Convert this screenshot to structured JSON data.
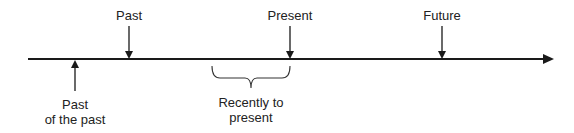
{
  "diagram": {
    "title": "",
    "axis": {
      "x_start": 28,
      "x_end": 553,
      "y": 59,
      "color": "#1a1a1a"
    },
    "markers": [
      {
        "label": "Past",
        "x": 129,
        "direction": "down"
      },
      {
        "label": "Present",
        "x": 290,
        "direction": "down"
      },
      {
        "label": "Future",
        "x": 442,
        "direction": "down"
      },
      {
        "label_line1": "Past",
        "label_line2": "of the past",
        "x": 75,
        "direction": "up"
      }
    ],
    "brace": {
      "x_start": 212,
      "x_end": 290,
      "label_line1": "Recently to",
      "label_line2": "present"
    }
  }
}
